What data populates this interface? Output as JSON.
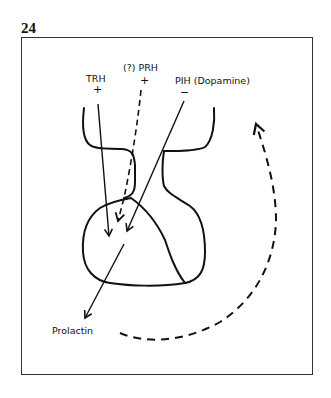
{
  "figure": {
    "number": "24"
  },
  "labels": {
    "trh": "TRH",
    "trh_sign": "+",
    "prh": "(?) PRH",
    "prh_sign": "+",
    "pih": "PIH (Dopamine)",
    "pih_sign": "−",
    "prolactin": "Prolactin"
  },
  "diagram": {
    "structures": [
      "hypothalamus/pituitary stalk outline",
      "anterior pituitary lobe",
      "posterior pituitary lobe"
    ],
    "arrows": [
      {
        "from": "TRH",
        "to": "anterior pituitary",
        "style": "solid",
        "effect": "+"
      },
      {
        "from": "(?) PRH",
        "to": "anterior pituitary",
        "style": "dashed",
        "effect": "+"
      },
      {
        "from": "PIH (Dopamine)",
        "to": "anterior pituitary",
        "style": "solid",
        "effect": "−"
      },
      {
        "from": "anterior pituitary",
        "to": "Prolactin",
        "style": "solid"
      },
      {
        "from": "Prolactin",
        "to": "hypothalamus",
        "style": "dashed",
        "type": "feedback loop"
      }
    ],
    "stroke_color": "#111111",
    "frame_color": "#333333"
  }
}
